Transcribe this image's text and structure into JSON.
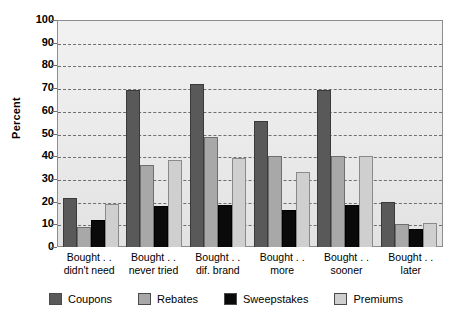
{
  "chart_data": {
    "type": "bar",
    "title": "",
    "xlabel": "",
    "ylabel": "Percent",
    "ylim": [
      0,
      100
    ],
    "yticks": [
      0,
      10,
      20,
      30,
      40,
      50,
      60,
      70,
      80,
      90,
      100
    ],
    "grid": true,
    "legend_position": "bottom",
    "categories": [
      "Bought .. didn't need",
      "Bought .. never tried",
      "Bought .. dif. brand",
      "Bought .. more",
      "Bought .. sooner",
      "Bought .. later"
    ],
    "category_lines": [
      [
        "Bought . .",
        "didn't need"
      ],
      [
        "Bought . .",
        "never tried"
      ],
      [
        "Bought . .",
        "dif. brand"
      ],
      [
        "Bought . .",
        "more"
      ],
      [
        "Bought . .",
        "sooner"
      ],
      [
        "Bought . .",
        "later"
      ]
    ],
    "series": [
      {
        "name": "Coupons",
        "color": "#595959",
        "values": [
          21.5,
          69,
          72,
          55.5,
          69,
          20
        ]
      },
      {
        "name": "Rebates",
        "color": "#a8a8a8",
        "values": [
          9,
          36,
          48.5,
          40,
          40,
          10
        ]
      },
      {
        "name": "Sweepstakes",
        "color": "#0a0a0a",
        "values": [
          12,
          18,
          18.5,
          16.5,
          18.5,
          8
        ]
      },
      {
        "name": "Premiums",
        "color": "#cfcfcf",
        "values": [
          19,
          38.5,
          39,
          33,
          40,
          10.5
        ]
      }
    ]
  }
}
